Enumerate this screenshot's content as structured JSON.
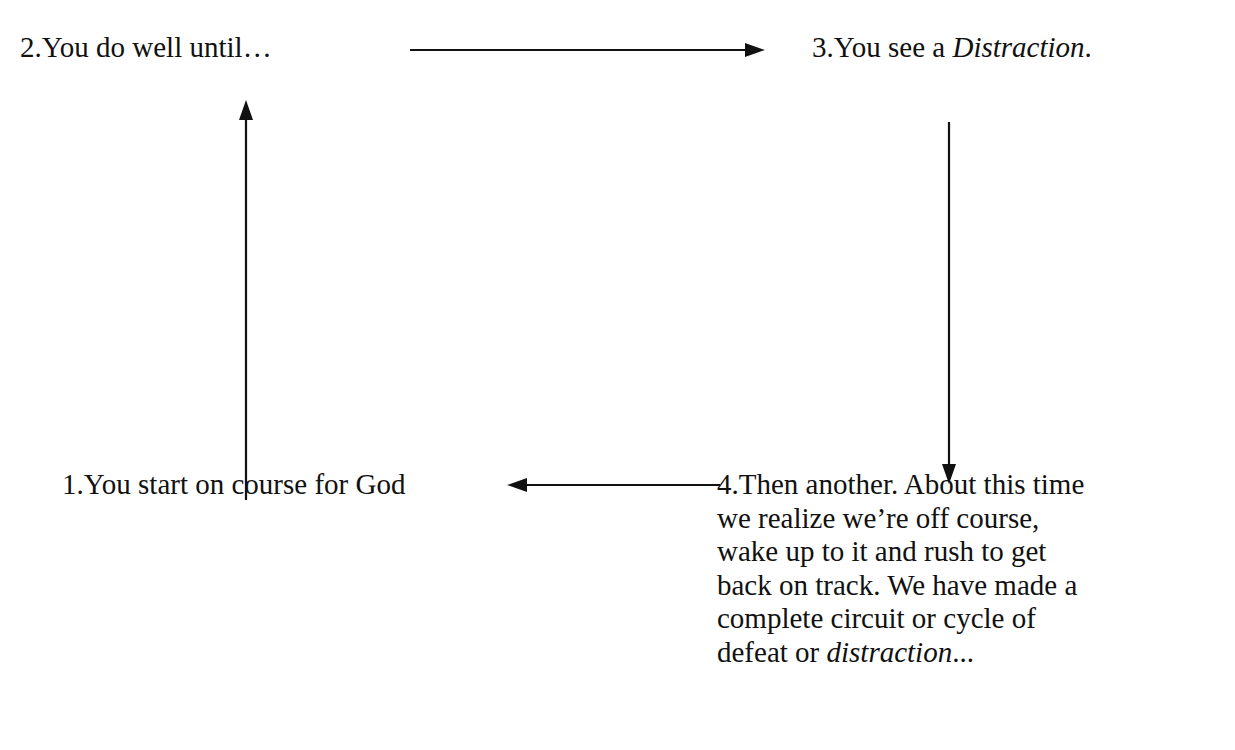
{
  "diagram": {
    "title": "",
    "nodes": [
      {
        "id": "n1",
        "number": "1.",
        "text": "You start on course for God"
      },
      {
        "id": "n2",
        "number": "2.",
        "text": "You do well until…"
      },
      {
        "id": "n3",
        "number": "3.",
        "text_prefix": "You see a ",
        "text_italic": "Distraction",
        "text_suffix": "."
      },
      {
        "id": "n4",
        "number": "4.",
        "lines": [
          "Then another. About this time",
          "we realize we’re off course,",
          "wake up to it and rush to get",
          "back on track. We have made a",
          "complete circuit or cycle of"
        ],
        "last_line_prefix": "defeat or ",
        "last_line_italic": "distraction",
        "last_line_suffix": "..."
      }
    ],
    "edges": [
      {
        "from": "n1",
        "to": "n2",
        "direction": "up"
      },
      {
        "from": "n2",
        "to": "n3",
        "direction": "right"
      },
      {
        "from": "n3",
        "to": "n4",
        "direction": "down"
      },
      {
        "from": "n4",
        "to": "n1",
        "direction": "left"
      }
    ],
    "colors": {
      "ink": "#111111",
      "background": "#ffffff"
    }
  }
}
